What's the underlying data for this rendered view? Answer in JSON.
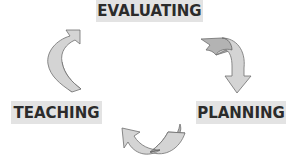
{
  "diagram": {
    "type": "cycle",
    "stages": [
      {
        "id": "evaluating",
        "label": "EVALUATING",
        "position": "top"
      },
      {
        "id": "planning",
        "label": "PLANNING",
        "position": "bottom-right"
      },
      {
        "id": "teaching",
        "label": "TEACHING",
        "position": "bottom-left"
      }
    ],
    "arrows": [
      {
        "from": "evaluating",
        "to": "planning",
        "position": "right"
      },
      {
        "from": "planning",
        "to": "teaching",
        "position": "bottom"
      },
      {
        "from": "teaching",
        "to": "evaluating",
        "position": "left"
      }
    ],
    "colors": {
      "label_background": "#e3e3e3",
      "label_text": "#2b2b2b",
      "arrow_light": "#d4d4d4",
      "arrow_dark": "#b3b3b3",
      "arrow_outline": "#6e6e6e"
    }
  }
}
